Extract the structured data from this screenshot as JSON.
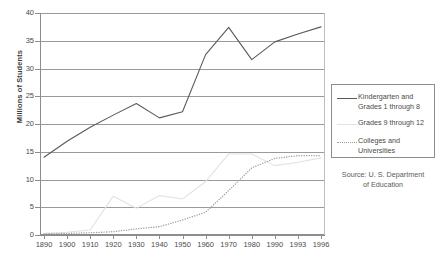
{
  "chart_data": {
    "type": "line",
    "title": "",
    "xlabel": "",
    "ylabel": "Millions of Students",
    "ylim": [
      0,
      40
    ],
    "ytick_step": 5,
    "yticks": [
      "0",
      "5",
      "10",
      "15",
      "20",
      "25",
      "30",
      "35",
      "40"
    ],
    "grid": true,
    "legend_position": "right",
    "categories": [
      "1890",
      "1900",
      "1910",
      "1920",
      "1930",
      "1940",
      "1950",
      "1960",
      "1970",
      "1980",
      "1990",
      "1993",
      "1996"
    ],
    "series": [
      {
        "name": "Kindergarten and Grades 1 through 8",
        "style": "solid",
        "color": "#5a5a5a",
        "values": [
          14.0,
          16.9,
          19.4,
          21.6,
          23.7,
          21.1,
          22.2,
          32.5,
          37.4,
          31.6,
          34.8,
          36.2,
          37.5
        ]
      },
      {
        "name": "Grades 9 through 12",
        "style": "solid",
        "color": "#e2e2e2",
        "values": [
          0.3,
          0.5,
          0.9,
          7.0,
          4.8,
          7.1,
          6.5,
          9.6,
          14.6,
          14.6,
          12.5,
          13.1,
          13.9
        ]
      },
      {
        "name": "Colleges and Universities",
        "style": "dotted",
        "color": "#9d9d9d",
        "values": [
          0.2,
          0.3,
          0.4,
          0.6,
          1.1,
          1.5,
          2.7,
          4.1,
          8.0,
          12.1,
          13.8,
          14.3,
          14.3
        ]
      }
    ],
    "source_note": "Source: U. S. Department of Education"
  },
  "legend": {
    "items": [
      {
        "label_line1": "Kindergarten and",
        "label_line2": "Grades 1 through 8",
        "swatch": "solid-dark-line-icon"
      },
      {
        "label_line1": "Grades 9 through 12",
        "label_line2": "",
        "swatch": "solid-light-line-icon"
      },
      {
        "label_line1": "Colleges and",
        "label_line2": "Universities",
        "swatch": "dotted-line-icon"
      }
    ]
  },
  "source": {
    "line1": "Source: U. S. Department",
    "line2": "of Education"
  }
}
